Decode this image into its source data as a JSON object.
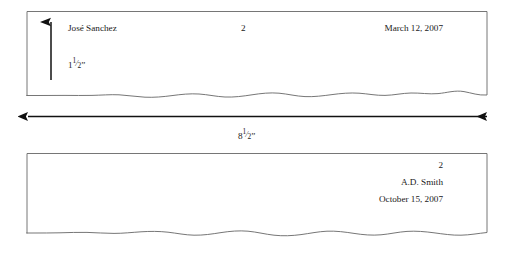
{
  "figure": {
    "type": "torn-paper-diagram",
    "background_color": "#ffffff",
    "line_color": "#555555",
    "arrow_color": "#111111",
    "text_color": "#1a1a1a"
  },
  "top_sheet": {
    "name_label": "José Sanchez",
    "page_number": "2",
    "date_label": "March 12, 2007",
    "margin_label_whole": "1",
    "margin_label_numerator": "1",
    "margin_label_denominator": "2",
    "margin_label_unit": "”",
    "margin_label_full": "1 1/2\""
  },
  "width_dimension": {
    "value_whole": "8",
    "value_numerator": "1",
    "value_denominator": "2",
    "value_unit": "”",
    "label_full": "8 1/2\""
  },
  "bottom_sheet": {
    "page_number": "2",
    "name_label": "A.D. Smith",
    "date_label": "October 15, 2007"
  }
}
